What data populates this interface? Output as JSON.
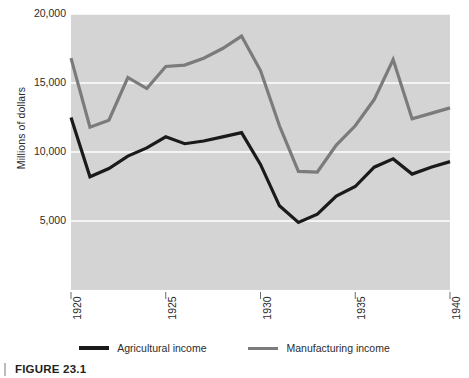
{
  "figure": {
    "caption": "FIGURE 23.1"
  },
  "chart_data": {
    "type": "line",
    "title": "",
    "xlabel": "",
    "ylabel": "Millions of dollars",
    "xlim": [
      1920,
      1940
    ],
    "ylim": [
      0,
      20000
    ],
    "grid": true,
    "grid_axis": "y",
    "plot_background": "#d4d4d4",
    "gridline_color": "#ffffff",
    "legend_position": "bottom-center",
    "x": [
      1920,
      1921,
      1922,
      1923,
      1924,
      1925,
      1926,
      1927,
      1928,
      1929,
      1930,
      1931,
      1932,
      1933,
      1934,
      1935,
      1936,
      1937,
      1938,
      1939,
      1940
    ],
    "y_ticks": [
      5000,
      10000,
      15000,
      20000
    ],
    "y_tick_labels": [
      "5,000",
      "10,000",
      "15,000",
      "20,000"
    ],
    "x_ticks": [
      1920,
      1925,
      1930,
      1935,
      1940
    ],
    "x_tick_labels": [
      "1920",
      "1925",
      "1930",
      "1935",
      "1940"
    ],
    "series": [
      {
        "name": "Agricultural income",
        "color": "#1a1a1a",
        "width": 3.2,
        "values": [
          12500,
          8200,
          8800,
          9700,
          10300,
          11100,
          10600,
          10800,
          11100,
          11400,
          9100,
          6100,
          4900,
          5500,
          6800,
          7500,
          8900,
          9500,
          8400,
          8900,
          9300
        ]
      },
      {
        "name": "Manufacturing income",
        "color": "#7b7b7b",
        "width": 3.2,
        "values": [
          16800,
          11800,
          12300,
          15400,
          14600,
          16200,
          16300,
          16800,
          17500,
          18400,
          15900,
          11900,
          8600,
          8550,
          10500,
          11900,
          13800,
          16700,
          12400,
          12800,
          13200
        ]
      }
    ]
  },
  "legend": {
    "entries": [
      {
        "label": "Agricultural income",
        "color": "#1a1a1a"
      },
      {
        "label": "Manufacturing income",
        "color": "#7b7b7b"
      }
    ]
  }
}
